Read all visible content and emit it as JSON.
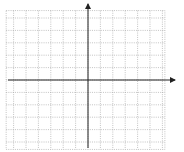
{
  "chart_data": {
    "type": "line",
    "title": "",
    "xlabel": "x",
    "ylabel": "y",
    "xlim": [
      -6,
      6
    ],
    "ylim": [
      -5,
      5
    ],
    "grid": true,
    "x_tick_labels": [
      "-5",
      "-4",
      "-3",
      "-2",
      "-1",
      "1",
      "2",
      "3",
      "4",
      "5"
    ],
    "y_tick_labels": [
      "4",
      "3",
      "2",
      "1",
      "-1",
      "-2",
      "-3",
      "-4"
    ],
    "series": [
      {
        "name": "L1",
        "points": [
          [
            0,
            2
          ],
          [
            3,
            -1
          ]
        ],
        "equation": "y = -x + 2"
      },
      {
        "name": "L2",
        "points": [
          [
            -3,
            -2
          ],
          [
            3,
            3
          ]
        ],
        "equation": "y = (5/6)x + 1/2"
      },
      {
        "name": "L3",
        "points": [
          [
            -3,
            -4
          ],
          [
            4,
            -4
          ]
        ],
        "equation": "y = -4"
      }
    ],
    "line_labels": [
      {
        "name": "L",
        "sub": "1"
      },
      {
        "name": "L",
        "sub": "2"
      },
      {
        "name": "L",
        "sub": "3"
      }
    ]
  }
}
